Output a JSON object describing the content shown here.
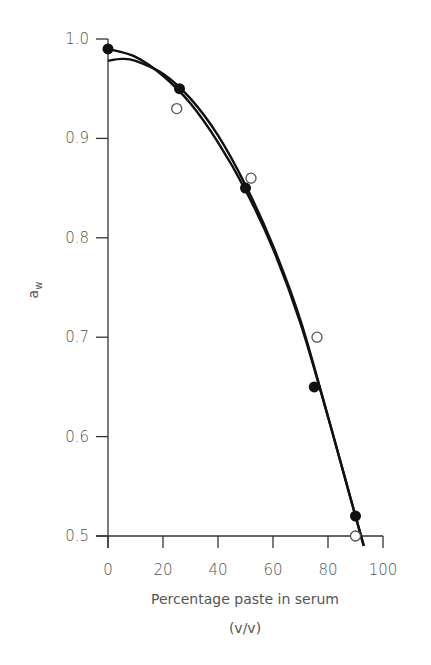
{
  "chart_data": {
    "type": "scatter",
    "title": "",
    "xlabel": "Percentage paste in serum",
    "xlabel_sub": "(v/v)",
    "ylabel": "a",
    "ylabel_subscript": "w",
    "xlim": [
      0,
      100
    ],
    "ylim": [
      0.5,
      1.0
    ],
    "x_ticks": [
      0,
      20,
      40,
      60,
      80,
      100
    ],
    "x_tick_labels": [
      "0",
      "20",
      "40",
      "60",
      "80",
      "100"
    ],
    "y_ticks": [
      0.5,
      0.6,
      0.7,
      0.8,
      0.9,
      1.0
    ],
    "y_tick_labels": [
      "0.5",
      "0.6",
      "0.7",
      "0.8",
      "0.9",
      "1.0"
    ],
    "grid": false,
    "legend": null,
    "series": [
      {
        "name": "filled circles",
        "marker": "filled-circle",
        "x": [
          0,
          26,
          50,
          75,
          90
        ],
        "y": [
          0.99,
          0.95,
          0.85,
          0.65,
          0.52
        ],
        "fit_curve": {
          "x": [
            0,
            10,
            20,
            30,
            40,
            50,
            60,
            70,
            80,
            88,
            93
          ],
          "y": [
            0.99,
            0.982,
            0.963,
            0.935,
            0.896,
            0.848,
            0.789,
            0.714,
            0.62,
            0.54,
            0.49
          ]
        }
      },
      {
        "name": "open circles",
        "marker": "open-circle",
        "x": [
          25,
          52,
          76,
          90
        ],
        "y": [
          0.93,
          0.86,
          0.7,
          0.5
        ],
        "fit_curve": {
          "x": [
            0,
            5,
            10,
            20,
            30,
            40,
            50,
            60,
            70,
            80,
            88,
            93
          ],
          "y": [
            0.978,
            0.98,
            0.978,
            0.965,
            0.94,
            0.903,
            0.853,
            0.792,
            0.717,
            0.62,
            0.54,
            0.49
          ]
        }
      }
    ],
    "colors": {
      "curve": "#111111",
      "filled_marker": "#111111",
      "open_marker_stroke": "#555555",
      "axis": "#333333",
      "text": "#555555"
    }
  }
}
